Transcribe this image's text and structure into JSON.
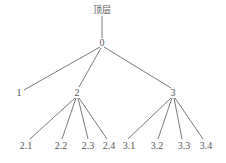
{
  "diagram": {
    "type": "tree",
    "root_label": "顶层",
    "nodes": [
      {
        "id": "top",
        "label": "顶层",
        "x": 102,
        "y": 13
      },
      {
        "id": "0",
        "label": "0",
        "x": 102,
        "y": 46
      },
      {
        "id": "1",
        "label": "1",
        "x": 19,
        "y": 96
      },
      {
        "id": "2",
        "label": "2",
        "x": 77,
        "y": 96
      },
      {
        "id": "3",
        "label": "3",
        "x": 173,
        "y": 96
      },
      {
        "id": "2.1",
        "label": "2.1",
        "x": 26,
        "y": 149
      },
      {
        "id": "2.2",
        "label": "2.2",
        "x": 61,
        "y": 149
      },
      {
        "id": "2.3",
        "label": "2.3",
        "x": 88,
        "y": 149
      },
      {
        "id": "2.4",
        "label": "2.4",
        "x": 109,
        "y": 149
      },
      {
        "id": "3.1",
        "label": "3.1",
        "x": 129,
        "y": 149
      },
      {
        "id": "3.2",
        "label": "3.2",
        "x": 157,
        "y": 149
      },
      {
        "id": "3.3",
        "label": "3.3",
        "x": 184,
        "y": 149
      },
      {
        "id": "3.4",
        "label": "3.4",
        "x": 206,
        "y": 149
      }
    ],
    "edges": [
      [
        "top",
        "0"
      ],
      [
        "0",
        "1"
      ],
      [
        "0",
        "2"
      ],
      [
        "0",
        "3"
      ],
      [
        "2",
        "2.1"
      ],
      [
        "2",
        "2.2"
      ],
      [
        "2",
        "2.3"
      ],
      [
        "2",
        "2.4"
      ],
      [
        "3",
        "3.1"
      ],
      [
        "3",
        "3.2"
      ],
      [
        "3",
        "3.3"
      ],
      [
        "3",
        "3.4"
      ]
    ]
  }
}
